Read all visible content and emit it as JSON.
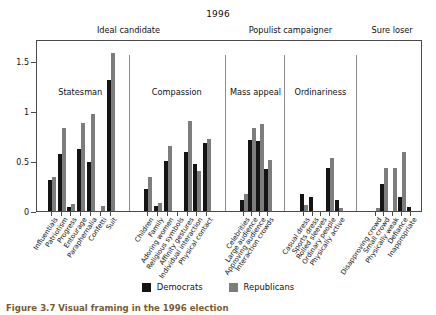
{
  "chart_data": {
    "type": "bar",
    "title": "1996",
    "xlabel": "",
    "ylabel": "",
    "ylim": [
      0,
      1.72
    ],
    "yticks": [
      0,
      0.5,
      1,
      1.5
    ],
    "ytick_labels": [
      "0",
      "0.5",
      "1",
      "1.5"
    ],
    "grid": false,
    "legend_position": "bottom-center",
    "series": [
      {
        "name": "Democrats",
        "color": "#141414",
        "values": [
          0.31,
          0.57,
          0.04,
          0.62,
          0.49,
          0.0,
          1.31,
          0.22,
          0.05,
          0.5,
          0.0,
          0.59,
          0.47,
          0.68,
          0.11,
          0.71,
          0.7,
          0.42,
          0.17,
          0.14,
          0.0,
          0.43,
          0.11,
          0.0,
          0.27,
          0.0,
          0.14,
          0.04
        ]
      },
      {
        "name": "Republicans",
        "color": "#7d7d7d",
        "values": [
          0.34,
          0.83,
          0.07,
          0.88,
          0.97,
          0.05,
          1.58,
          0.34,
          0.08,
          0.65,
          0.0,
          0.9,
          0.4,
          0.72,
          0.17,
          0.83,
          0.87,
          0.51,
          0.06,
          0.0,
          0.0,
          0.53,
          0.03,
          0.03,
          0.43,
          0.43,
          0.59,
          0.0
        ]
      }
    ],
    "categories": [
      "Influentials",
      "Patriotism",
      "Progress",
      "Entourage",
      "Paraphernalia",
      "Confetti",
      "Suit",
      "Children",
      "Family",
      "Adoring women",
      "Religious symbols",
      "Affinity gestures",
      "Individual interaction",
      "Physical contact",
      "Celebrities",
      "Large audience",
      "Approving audience",
      "Interaction crowds",
      "Casual dress",
      "Sports dress",
      "Rolled sleeves",
      "Ordinary people",
      "Physically active",
      "Disapproving crowd",
      "Small crowd",
      "Physically weak",
      "Defiance",
      "Inappropriate"
    ],
    "panels": [
      {
        "label": "Statesman",
        "start": 0,
        "count": 7
      },
      {
        "label": "Compassion",
        "start": 7,
        "count": 7
      },
      {
        "label": "Mass appeal",
        "start": 14,
        "count": 4
      },
      {
        "label": "Ordinariness",
        "start": 18,
        "count": 5
      },
      {
        "label": "",
        "start": 23,
        "count": 5
      }
    ],
    "supergroups": [
      {
        "label": "Ideal candidate",
        "start": 0,
        "count": 14
      },
      {
        "label": "Populist campaigner",
        "start": 14,
        "count": 9
      },
      {
        "label": "Sure loser",
        "start": 23,
        "count": 5
      }
    ]
  },
  "legend": {
    "items": [
      {
        "label": "Democrats",
        "color": "#141414"
      },
      {
        "label": "Republicans",
        "color": "#7d7d7d"
      }
    ]
  },
  "caption": {
    "text": "Figure 3.7 Visual framing in the 1996 election"
  }
}
